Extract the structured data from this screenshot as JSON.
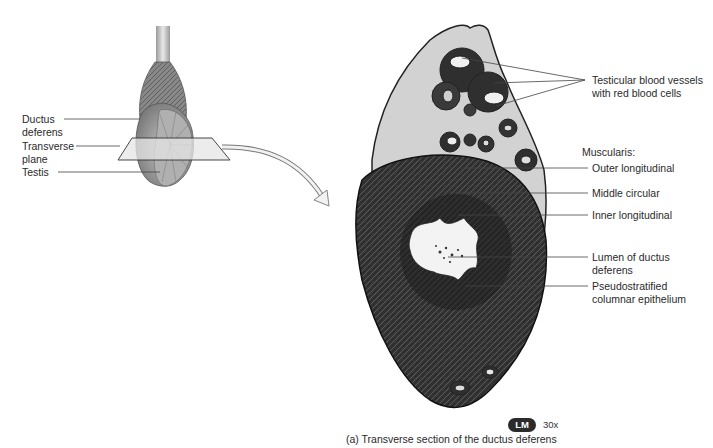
{
  "figure": {
    "caption": "(a)  Transverse section of the ductus deferens",
    "microscopy_badge": "LM",
    "magnification": "30x"
  },
  "left_illustration": {
    "labels": [
      {
        "id": "ductus-deferens",
        "line1": "Ductus",
        "line2": "deferens"
      },
      {
        "id": "transverse-plane",
        "line1": "Transverse",
        "line2": "plane"
      },
      {
        "id": "testis",
        "line1": "Testis"
      }
    ]
  },
  "micrograph": {
    "labels": {
      "blood_vessels_1": "Testicular blood vessels",
      "blood_vessels_2": "with red blood cells",
      "muscularis_header": "Muscularis:",
      "outer_longitudinal": "Outer longitudinal",
      "middle_circular": "Middle circular",
      "inner_longitudinal": "Inner longitudinal",
      "lumen_1": "Lumen of ductus",
      "lumen_2": "deferens",
      "epithelium_1": "Pseudostratified",
      "epithelium_2": "columnar epithelium"
    }
  },
  "colors": {
    "tissue_dark": "#2e2e2e",
    "tissue_mid": "#5a5a5a",
    "connective": "#cfcfcf",
    "lumen": "#f4f4f4",
    "leader_line": "#444444",
    "badge_bg": "#2b2b2b"
  }
}
